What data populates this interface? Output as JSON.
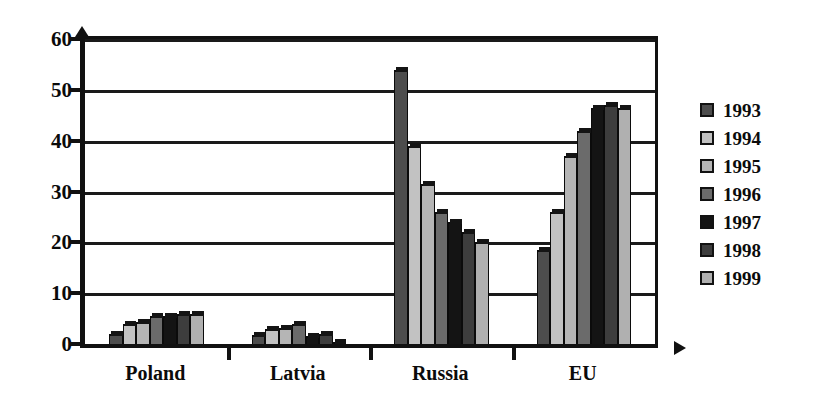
{
  "chart_data": {
    "type": "bar",
    "title": "",
    "subtitle": "",
    "xlabel": "",
    "ylabel": "",
    "ylim": [
      0,
      60
    ],
    "ytick_step": 10,
    "yticks": [
      "0",
      "10",
      "20",
      "30",
      "40",
      "50",
      "60"
    ],
    "grid": true,
    "legend_position": "right",
    "categories": [
      "Poland",
      "Latvia",
      "Russia",
      "EU"
    ],
    "series": [
      {
        "name": "1993",
        "color": "#4d4d4d",
        "values": [
          2.0,
          1.8,
          54.0,
          18.5
        ]
      },
      {
        "name": "1994",
        "color": "#c2c2c2",
        "values": [
          4.0,
          3.0,
          39.0,
          26.0
        ]
      },
      {
        "name": "1995",
        "color": "#b5b5b5",
        "values": [
          4.3,
          3.2,
          31.5,
          37.0
        ]
      },
      {
        "name": "1996",
        "color": "#6b6b6b",
        "values": [
          5.5,
          4.0,
          26.0,
          42.0
        ]
      },
      {
        "name": "1997",
        "color": "#141414",
        "values": [
          5.5,
          1.5,
          24.0,
          46.5
        ]
      },
      {
        "name": "1998",
        "color": "#3d3d3d",
        "values": [
          6.0,
          2.0,
          22.0,
          47.0
        ]
      },
      {
        "name": "1999",
        "color": "#b0b0b0",
        "values": [
          6.0,
          0.4,
          20.0,
          46.5
        ]
      }
    ]
  },
  "legend": {
    "items": [
      {
        "label": "1993",
        "color": "#4d4d4d"
      },
      {
        "label": "1994",
        "color": "#c2c2c2"
      },
      {
        "label": "1995",
        "color": "#b5b5b5"
      },
      {
        "label": "1996",
        "color": "#6b6b6b"
      },
      {
        "label": "1997",
        "color": "#141414"
      },
      {
        "label": "1998",
        "color": "#3d3d3d"
      },
      {
        "label": "1999",
        "color": "#b0b0b0"
      }
    ]
  }
}
